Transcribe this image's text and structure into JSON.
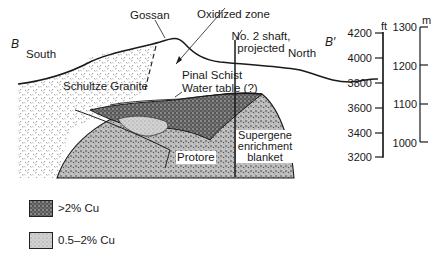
{
  "figure": {
    "section_start": "B",
    "section_end": "B′",
    "direction_left": "South",
    "direction_right": "North"
  },
  "labels": {
    "gossan": "Gossan",
    "oxidized_zone": "Oxidized zone",
    "shaft_line1": "No. 2 shaft,",
    "shaft_line2": "projected",
    "pinal_schist": "Pinal Schist",
    "water_table": "Water table (?)",
    "schultze_granite": "Schultze Granite",
    "protore": "Protore",
    "supergene_line1": "Supergene",
    "supergene_line2": "enrichment",
    "supergene_line3": "blanket"
  },
  "scales": {
    "feet": {
      "unit": "ft",
      "ticks": [
        "4200",
        "4000",
        "3800",
        "3600",
        "3400",
        "3200"
      ]
    },
    "meters": {
      "unit": "m",
      "ticks": [
        "1300",
        "1200",
        "1100",
        "1000"
      ]
    }
  },
  "legend": [
    {
      "label": ">2% Cu",
      "pattern": "dense-stipple"
    },
    {
      "label": "0.5–2% Cu",
      "pattern": "light-stipple"
    }
  ],
  "colors": {
    "ink": "#1a1a1a",
    "dense_fill": "#6e6e6e",
    "light_fill": "#c8c8c8",
    "granite_fill": "#e6e6e6"
  }
}
